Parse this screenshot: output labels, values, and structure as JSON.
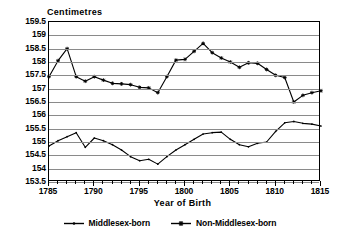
{
  "chart_data": {
    "type": "line",
    "title": "",
    "ylabel": "Centimetres",
    "xlabel": "Year of Birth",
    "ylim": [
      153.5,
      159.5
    ],
    "xlim": [
      1785,
      1815
    ],
    "ytick_labels": [
      "159.5",
      "159",
      "158.5",
      "158",
      "157.5",
      "157",
      "156.5",
      "156",
      "155.5",
      "155",
      "154.5",
      "154",
      "153.5"
    ],
    "ytick_values": [
      159.5,
      159,
      158.5,
      158,
      157.5,
      157,
      156.5,
      156,
      155.5,
      155,
      154.5,
      154,
      153.5
    ],
    "xtick_labels": [
      "1785",
      "1790",
      "1795",
      "1800",
      "1805",
      "1810",
      "1815"
    ],
    "xtick_values": [
      1785,
      1790,
      1795,
      1800,
      1805,
      1810,
      1815
    ],
    "grid": "horizontal",
    "legend_position": "bottom",
    "x": [
      1785,
      1786,
      1787,
      1788,
      1789,
      1790,
      1791,
      1792,
      1793,
      1794,
      1795,
      1796,
      1797,
      1798,
      1799,
      1800,
      1801,
      1802,
      1803,
      1804,
      1805,
      1806,
      1807,
      1808,
      1809,
      1810,
      1811,
      1812,
      1813,
      1814,
      1815
    ],
    "series": [
      {
        "name": "Middlesex-born",
        "marker": "small-dot",
        "color": "#000000",
        "values": [
          154.85,
          155.05,
          155.2,
          155.35,
          154.8,
          155.15,
          155.05,
          154.9,
          154.7,
          154.45,
          154.3,
          154.35,
          154.17,
          154.45,
          154.7,
          154.9,
          155.1,
          155.3,
          155.35,
          155.37,
          155.1,
          154.9,
          154.82,
          154.95,
          155.0,
          155.4,
          155.72,
          155.77,
          155.7,
          155.67,
          155.6
        ]
      },
      {
        "name": "Non-Middlesex-born",
        "marker": "star",
        "color": "#000000",
        "values": [
          157.45,
          158.05,
          158.5,
          157.45,
          157.28,
          157.45,
          157.32,
          157.2,
          157.18,
          157.15,
          157.05,
          157.03,
          156.85,
          157.45,
          158.07,
          158.1,
          158.4,
          158.7,
          158.35,
          158.15,
          158.0,
          157.8,
          157.97,
          157.95,
          157.72,
          157.5,
          157.42,
          156.5,
          156.75,
          156.85,
          156.92
        ]
      }
    ]
  },
  "legend": {
    "items": [
      {
        "label": "Middlesex-born",
        "marker": "small-dot"
      },
      {
        "label": "Non-Middlesex-born",
        "marker": "star"
      }
    ]
  }
}
